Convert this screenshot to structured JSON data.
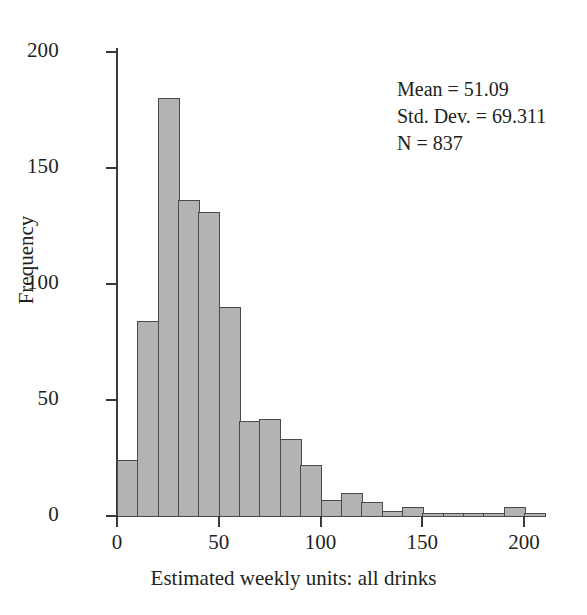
{
  "chart_data": {
    "type": "bar",
    "title": "",
    "subtitle": "",
    "xlabel": "Estimated weekly units: all drinks",
    "ylabel": "Frequency",
    "xlim": [
      0,
      210
    ],
    "ylim": [
      0,
      210
    ],
    "xticks": [
      0,
      50,
      100,
      150,
      200
    ],
    "xtick_labels": [
      "0",
      "50",
      "100",
      "150",
      "200"
    ],
    "yticks": [
      0,
      50,
      100,
      150,
      200
    ],
    "ytick_labels": [
      "0",
      "50",
      "100",
      "150",
      "200"
    ],
    "grid": false,
    "legend": "none",
    "bin_width": 10,
    "bin_starts": [
      0,
      10,
      20,
      30,
      40,
      50,
      60,
      70,
      80,
      90,
      100,
      110,
      120,
      130,
      140,
      150,
      160,
      170,
      180,
      190,
      200
    ],
    "categories": [
      "0-10",
      "10-20",
      "20-30",
      "30-40",
      "40-50",
      "50-60",
      "60-70",
      "70-80",
      "80-90",
      "90-100",
      "100-110",
      "110-120",
      "120-130",
      "130-140",
      "140-150",
      "150-160",
      "160-170",
      "170-180",
      "180-190",
      "190-200",
      "200-210"
    ],
    "values": [
      24,
      84,
      180,
      136,
      131,
      90,
      41,
      42,
      33,
      22,
      7,
      10,
      6,
      2,
      4,
      1,
      1,
      1,
      1,
      4,
      1
    ],
    "bar_fill_color": "#b3b3b3",
    "bar_edge_color": "#4a4a4a",
    "axis_color": "#3a3a3a",
    "background_color": "#ffffff",
    "annotations": [
      "Mean = 51.09",
      "Std. Dev. = 69.311",
      "N = 837"
    ]
  },
  "stats": {
    "mean_line": "Mean = 51.09",
    "std_line": "Std. Dev. = 69.311",
    "n_line": "N = 837",
    "mean_value": 51.09,
    "std_dev_value": 69.311,
    "n_value": 837
  },
  "axes": {
    "x_title": "Estimated weekly units: all drinks",
    "y_title": "Frequency",
    "x_tick_labels": [
      "0",
      "50",
      "100",
      "150",
      "200"
    ],
    "y_tick_labels": [
      "0",
      "50",
      "100",
      "150",
      "200"
    ]
  }
}
